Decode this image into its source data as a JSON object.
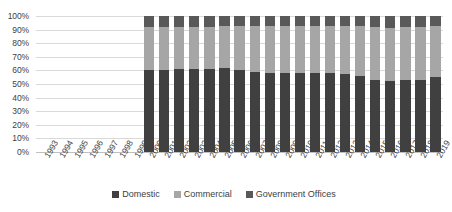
{
  "chart_data": {
    "type": "bar",
    "stacked": true,
    "normalized": "100%",
    "title": "",
    "subtitle": "",
    "xlabel": "",
    "ylabel": "",
    "ylim": [
      0,
      100
    ],
    "grid": true,
    "legend_position": "bottom",
    "y_tick_labels": [
      "100%",
      "90%",
      "80%",
      "70%",
      "60%",
      "50%",
      "40%",
      "30%",
      "20%",
      "10%",
      "0%"
    ],
    "y_tick_values": [
      100,
      90,
      80,
      70,
      60,
      50,
      40,
      30,
      20,
      10,
      0
    ],
    "categories": [
      "1993",
      "1994",
      "1995",
      "1996",
      "1997",
      "1998",
      "1999",
      "2000",
      "2001",
      "2002",
      "2003",
      "2004",
      "2005",
      "2006",
      "2007",
      "2008",
      "2009",
      "2010",
      "2011",
      "2012",
      "2013",
      "2014",
      "2015",
      "2016",
      "2017",
      "2018",
      "2019"
    ],
    "series": [
      {
        "name": "Domestic",
        "color": "#404040",
        "values": [
          null,
          null,
          null,
          null,
          null,
          null,
          null,
          60,
          60,
          61,
          61,
          61,
          62,
          60,
          59,
          58,
          58,
          58,
          58,
          58,
          57,
          56,
          53,
          52,
          53,
          53,
          55
        ]
      },
      {
        "name": "Commercial",
        "color": "#a6a6a6",
        "values": [
          null,
          null,
          null,
          null,
          null,
          null,
          null,
          32,
          32,
          31,
          31,
          31,
          31,
          33,
          34,
          35,
          35,
          35,
          35,
          35,
          36,
          37,
          39,
          39,
          39,
          39,
          38
        ]
      },
      {
        "name": "Government Offices",
        "color": "#595959",
        "values": [
          null,
          null,
          null,
          null,
          null,
          null,
          null,
          8,
          8,
          8,
          8,
          8,
          7,
          7,
          7,
          7,
          7,
          7,
          7,
          7,
          7,
          7,
          8,
          9,
          8,
          8,
          7
        ]
      }
    ],
    "legend": [
      {
        "label": "Domestic",
        "color": "#404040"
      },
      {
        "label": "Commercial",
        "color": "#a6a6a6"
      },
      {
        "label": "Government Offices",
        "color": "#595959"
      }
    ]
  }
}
